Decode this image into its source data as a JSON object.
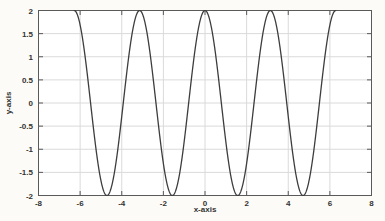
{
  "figure": {
    "background": "#fcfbf7",
    "plot_background": "#ffffff"
  },
  "chart_data": {
    "type": "line",
    "title": "",
    "xlabel": "x-axis",
    "ylabel": "y-axis",
    "xlim": [
      -8,
      8
    ],
    "ylim": [
      -2,
      2
    ],
    "xticks": [
      -8,
      -6,
      -4,
      -2,
      0,
      2,
      4,
      6,
      8
    ],
    "xtick_labels": [
      "-8",
      "-6",
      "-4",
      "-2",
      "0",
      "2",
      "4",
      "6",
      "8"
    ],
    "yticks": [
      -2,
      -1.5,
      -1,
      -0.5,
      0,
      0.5,
      1,
      1.5,
      2
    ],
    "ytick_labels": [
      "-2",
      "-1.5",
      "-1",
      "-0.5",
      "0",
      "0.5",
      "1",
      "1.5",
      "2"
    ],
    "grid": true,
    "box": true,
    "legend": "none",
    "series": [
      {
        "name": "y = 2*cos(2*x)",
        "amplitude": 2,
        "angular_frequency": 2,
        "phase": 0,
        "x_start": -6.283185307,
        "x_end": 6.283185307,
        "color": "#3d3d3d",
        "line_width": 1.3
      }
    ],
    "key_points": {
      "maxima": [
        [
          -6.2832,
          2
        ],
        [
          -3.1416,
          2
        ],
        [
          0,
          2
        ],
        [
          3.1416,
          2
        ],
        [
          6.2832,
          2
        ]
      ],
      "minima": [
        [
          -4.7124,
          -2
        ],
        [
          -1.5708,
          -2
        ],
        [
          1.5708,
          -2
        ],
        [
          4.7124,
          -2
        ]
      ],
      "zero_crossings_x": [
        -5.4978,
        -3.927,
        -2.3562,
        -0.7854,
        0.7854,
        2.3562,
        3.927,
        5.4978
      ]
    },
    "colors": {
      "grid": "#dadada",
      "axis": "#5a5a5a",
      "tick_text": "#333333"
    }
  }
}
